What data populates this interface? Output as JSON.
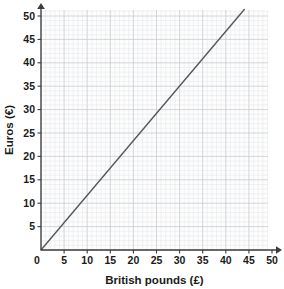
{
  "chart_data": {
    "type": "line",
    "title": "",
    "xlabel": "British pounds (£)",
    "ylabel": "Euros (€)",
    "xlim": [
      0,
      50
    ],
    "ylim": [
      0,
      51
    ],
    "xticks": [
      0,
      5,
      10,
      15,
      20,
      25,
      30,
      35,
      40,
      45,
      50
    ],
    "yticks": [
      0,
      5,
      10,
      15,
      20,
      25,
      30,
      35,
      40,
      45,
      50
    ],
    "xtick_labels": [
      "0",
      "5",
      "10",
      "15",
      "20",
      "25",
      "30",
      "35",
      "40",
      "45",
      "50"
    ],
    "ytick_labels": [
      "0",
      "5",
      "10",
      "15",
      "20",
      "25",
      "30",
      "35",
      "40",
      "45",
      "50"
    ],
    "grid": true,
    "grid_minor_step": 1,
    "grid_major_step": 5,
    "legend": false,
    "legend_position": "none",
    "series": [
      {
        "name": "pounds-to-euros",
        "points": [
          [
            0,
            0
          ],
          [
            44,
            51.4
          ]
        ],
        "slope": 1.168,
        "color": "#555a60"
      }
    ],
    "axis_color": "#3c3c3c",
    "grid_minor_color": "#e3e5e8",
    "grid_major_color": "#c9ccd1",
    "plot_background": "#fdfdfd",
    "page_background": "#ffffff"
  },
  "axes": {
    "x_title": "British pounds (£)",
    "y_title": "Euros (€)"
  },
  "icons": {
    "x_axis_arrow": "arrow-right-icon",
    "y_axis_arrow": "arrow-up-icon"
  }
}
